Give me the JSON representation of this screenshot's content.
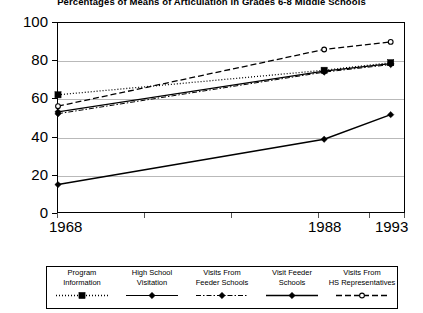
{
  "title": "Percentages of Means of Articulation in Grades 6-8 Middle Schools",
  "axes": {
    "y_ticks": [
      "0",
      "20",
      "40",
      "60",
      "80",
      "100"
    ],
    "x_ticks": [
      "1968",
      "1988",
      "1993"
    ]
  },
  "legend": {
    "items": [
      {
        "label_line1": "Program",
        "label_line2": "Information",
        "marker": "filled-square-marker",
        "line": "dotted"
      },
      {
        "label_line1": "High School",
        "label_line2": "Visitation",
        "marker": "filled-diamond-marker",
        "line": "solid"
      },
      {
        "label_line1": "Visits From",
        "label_line2": "Feeder Schools",
        "marker": "filled-diamond-marker",
        "line": "dash-dot"
      },
      {
        "label_line1": "Visit Feeder",
        "label_line2": "Schools",
        "marker": "filled-diamond-marker",
        "line": "solid"
      },
      {
        "label_line1": "Visits From",
        "label_line2": "HS Representatives",
        "marker": "hollow-circle-marker",
        "line": "dashed"
      }
    ]
  },
  "chart_data": {
    "type": "line",
    "title": "Percentages of Means of Articulation in Grades 6-8 Middle Schools",
    "xlabel": "",
    "ylabel": "",
    "x": [
      "1968",
      "1988",
      "1993"
    ],
    "x_positions": [
      0,
      100,
      125
    ],
    "xlim": [
      0,
      130
    ],
    "ylim": [
      0,
      100
    ],
    "yticks": [
      0,
      20,
      40,
      60,
      80,
      100
    ],
    "grid": "horizontal",
    "legend_position": "bottom",
    "series": [
      {
        "name": "Program Information",
        "values": [
          62,
          75,
          79
        ],
        "marker": "square",
        "dash": "dotted",
        "width": 1.3
      },
      {
        "name": "High School Visitation",
        "values": [
          53,
          74.5,
          78.5
        ],
        "marker": "diamond",
        "dash": "solid",
        "width": 1.2
      },
      {
        "name": "Visits From Feeder Schools",
        "values": [
          52,
          74,
          78
        ],
        "marker": "diamond",
        "dash": "dash-dot",
        "width": 1.0
      },
      {
        "name": "Visit Feeder Schools",
        "values": [
          14.5,
          38.5,
          51.5
        ],
        "marker": "diamond",
        "dash": "solid",
        "width": 1.5
      },
      {
        "name": "Visits From HS Representatives",
        "values": [
          56,
          86,
          90
        ],
        "marker": "circle",
        "dash": "dashed",
        "width": 1.3
      }
    ]
  }
}
